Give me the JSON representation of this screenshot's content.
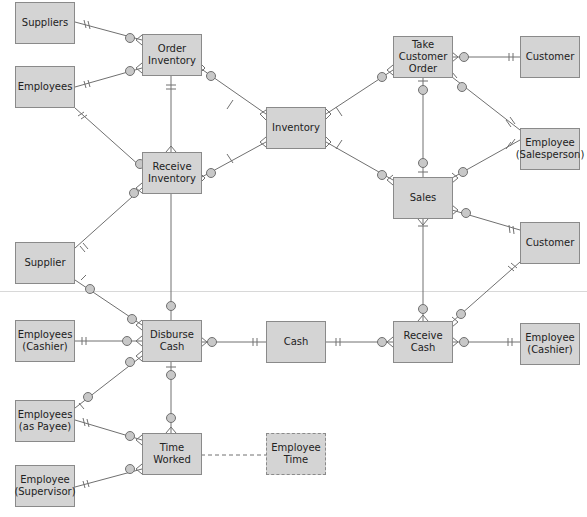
{
  "diagram": {
    "type": "REA entity-relationship diagram",
    "entities": [
      {
        "id": "suppliers",
        "label": "Suppliers",
        "x": 15,
        "y": 2
      },
      {
        "id": "order_inventory",
        "label": "Order\nInventory",
        "x": 142,
        "y": 34
      },
      {
        "id": "employees",
        "label": "Employees",
        "x": 15,
        "y": 66
      },
      {
        "id": "inventory",
        "label": "Inventory",
        "x": 266,
        "y": 107
      },
      {
        "id": "take_customer_order",
        "label": "Take\nCustomer\nOrder",
        "x": 393,
        "y": 36
      },
      {
        "id": "customer_top",
        "label": "Customer",
        "x": 520,
        "y": 36
      },
      {
        "id": "receive_inventory",
        "label": "Receive\nInventory",
        "x": 142,
        "y": 152
      },
      {
        "id": "employee_salesperson",
        "label": "Employee\n(Salesperson)",
        "x": 520,
        "y": 128
      },
      {
        "id": "sales",
        "label": "Sales",
        "x": 393,
        "y": 177
      },
      {
        "id": "customer_mid",
        "label": "Customer",
        "x": 520,
        "y": 222
      },
      {
        "id": "supplier",
        "label": "Supplier",
        "x": 15,
        "y": 242
      },
      {
        "id": "employees_cashier",
        "label": "Employees\n(Cashier)",
        "x": 15,
        "y": 320
      },
      {
        "id": "disburse_cash",
        "label": "Disburse\nCash",
        "x": 142,
        "y": 320
      },
      {
        "id": "cash",
        "label": "Cash",
        "x": 266,
        "y": 321
      },
      {
        "id": "receive_cash",
        "label": "Receive\nCash",
        "x": 393,
        "y": 321
      },
      {
        "id": "employee_cashier",
        "label": "Employee\n(Cashier)",
        "x": 520,
        "y": 323
      },
      {
        "id": "employees_as_payee",
        "label": "Employees\n(as Payee)",
        "x": 15,
        "y": 400
      },
      {
        "id": "time_worked",
        "label": "Time\nWorked",
        "x": 142,
        "y": 433
      },
      {
        "id": "employee_time",
        "label": "Employee\nTime",
        "x": 266,
        "y": 433,
        "dashed": true
      },
      {
        "id": "employee_supervisor",
        "label": "Employee\n(Supervisor)",
        "x": 15,
        "y": 465
      }
    ],
    "relationships": [
      {
        "from": "suppliers",
        "to": "order_inventory"
      },
      {
        "from": "employees",
        "to": "order_inventory"
      },
      {
        "from": "employees",
        "to": "receive_inventory"
      },
      {
        "from": "order_inventory",
        "to": "receive_inventory"
      },
      {
        "from": "order_inventory",
        "to": "inventory"
      },
      {
        "from": "receive_inventory",
        "to": "inventory"
      },
      {
        "from": "inventory",
        "to": "take_customer_order"
      },
      {
        "from": "inventory",
        "to": "sales"
      },
      {
        "from": "take_customer_order",
        "to": "customer_top"
      },
      {
        "from": "take_customer_order",
        "to": "employee_salesperson"
      },
      {
        "from": "take_customer_order",
        "to": "sales"
      },
      {
        "from": "sales",
        "to": "employee_salesperson"
      },
      {
        "from": "sales",
        "to": "customer_mid"
      },
      {
        "from": "sales",
        "to": "receive_cash"
      },
      {
        "from": "receive_cash",
        "to": "customer_mid"
      },
      {
        "from": "receive_cash",
        "to": "employee_cashier"
      },
      {
        "from": "cash",
        "to": "receive_cash"
      },
      {
        "from": "disburse_cash",
        "to": "cash"
      },
      {
        "from": "receive_inventory",
        "to": "supplier"
      },
      {
        "from": "receive_inventory",
        "to": "disburse_cash"
      },
      {
        "from": "supplier",
        "to": "disburse_cash"
      },
      {
        "from": "employees_cashier",
        "to": "disburse_cash"
      },
      {
        "from": "employees_as_payee",
        "to": "disburse_cash"
      },
      {
        "from": "disburse_cash",
        "to": "time_worked"
      },
      {
        "from": "employees_as_payee",
        "to": "time_worked"
      },
      {
        "from": "employee_supervisor",
        "to": "time_worked"
      },
      {
        "from": "time_worked",
        "to": "employee_time",
        "style": "dashed"
      }
    ],
    "colors": {
      "entity_fill": "#d4d4d4",
      "entity_border": "#8a8a8a",
      "line": "#707070",
      "circle_fill": "#c8c8c8"
    }
  }
}
